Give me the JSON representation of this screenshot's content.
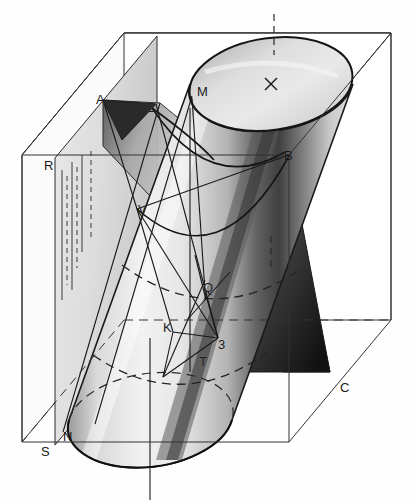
{
  "figure": {
    "background_color": "#fefefe",
    "ink_color": "#111111",
    "line_color": "#222222"
  },
  "labels": [
    {
      "id": "A",
      "text": "A",
      "x": 96,
      "y": 93,
      "tone": "light"
    },
    {
      "id": "2",
      "text": "2",
      "x": 148,
      "y": 101,
      "tone": "light"
    },
    {
      "id": "M",
      "text": "M",
      "x": 197,
      "y": 85,
      "tone": "light"
    },
    {
      "id": "B",
      "text": "B",
      "x": 284,
      "y": 149,
      "tone": "onDark"
    },
    {
      "id": "R",
      "text": "R",
      "x": 44,
      "y": 159,
      "tone": "light"
    },
    {
      "id": "V",
      "text": "V",
      "x": 138,
      "y": 203,
      "tone": "onDark"
    },
    {
      "id": "Q",
      "text": "Q",
      "x": 203,
      "y": 281,
      "tone": "light"
    },
    {
      "id": "K",
      "text": "K",
      "x": 163,
      "y": 321,
      "tone": "light"
    },
    {
      "id": "3",
      "text": "3",
      "x": 218,
      "y": 338,
      "tone": "light"
    },
    {
      "id": "T",
      "text": "T",
      "x": 199,
      "y": 355,
      "tone": "light"
    },
    {
      "id": "C",
      "text": "C",
      "x": 340,
      "y": 381,
      "tone": "light"
    },
    {
      "id": "N",
      "text": "N",
      "x": 63,
      "y": 430,
      "tone": "onDark"
    },
    {
      "id": "S",
      "text": "S",
      "x": 41,
      "y": 445,
      "tone": "light"
    }
  ],
  "center_mark": {
    "id": "X",
    "symbol": "cross",
    "x": 271,
    "y": 84
  },
  "geometry": {
    "box": {
      "front_top_left": [
        22,
        155
      ],
      "front_top_right": [
        289,
        155
      ],
      "front_bottom_left": [
        22,
        442
      ],
      "front_bottom_right": [
        289,
        442
      ],
      "back_top_left": [
        124,
        33
      ],
      "back_top_right": [
        391,
        33
      ],
      "back_bottom_left": [
        124,
        320
      ],
      "back_bottom_right": [
        391,
        320
      ]
    },
    "top_ellipse": {
      "cx": 271,
      "cy": 84,
      "rx": 82,
      "ry": 46,
      "rotation": -8
    },
    "bottom_ellipse": {
      "cx": 150,
      "cy": 420,
      "rx": 82,
      "ry": 46,
      "rotation": -8
    },
    "cylinder_axis": {
      "from": [
        271,
        84
      ],
      "to": [
        150,
        420
      ]
    }
  }
}
